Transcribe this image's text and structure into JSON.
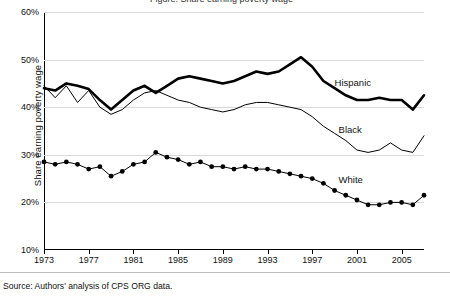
{
  "top_partial_title": "Figure: Share earning poverty wage",
  "axis": {
    "ylabel": "Share earning poverty wage",
    "yticks": [
      "10%",
      "20%",
      "30%",
      "40%",
      "50%",
      "60%"
    ],
    "xticks": [
      "1973",
      "1977",
      "1981",
      "1985",
      "1989",
      "1993",
      "1997",
      "2001",
      "2005"
    ]
  },
  "labels": {
    "hispanic": "Hispanic",
    "black": "Black",
    "white": "White"
  },
  "source": "Source: Authors' analysis of CPS ORG data.",
  "chart_data": {
    "type": "line",
    "title": "Share earning poverty wage",
    "xlabel": "",
    "ylabel": "Share earning poverty wage",
    "xlim": [
      1973,
      2007
    ],
    "ylim": [
      10,
      60
    ],
    "ytick_values": [
      10,
      20,
      30,
      40,
      50,
      60
    ],
    "ytick_labels": [
      "10%",
      "20%",
      "30%",
      "40%",
      "50%",
      "60%"
    ],
    "xtick_values": [
      1973,
      1977,
      1981,
      1985,
      1989,
      1993,
      1997,
      2001,
      2005
    ],
    "grid": false,
    "legend": "inline-annotations",
    "x": [
      1973,
      1974,
      1975,
      1976,
      1977,
      1978,
      1979,
      1980,
      1981,
      1982,
      1983,
      1984,
      1985,
      1986,
      1987,
      1988,
      1989,
      1990,
      1991,
      1992,
      1993,
      1994,
      1995,
      1996,
      1997,
      1998,
      1999,
      2000,
      2001,
      2002,
      2003,
      2004,
      2005,
      2006,
      2007
    ],
    "series": [
      {
        "name": "Hispanic",
        "style": "thick-line",
        "values": [
          44.0,
          43.5,
          45.0,
          44.5,
          43.8,
          41.5,
          39.5,
          41.5,
          43.5,
          44.5,
          43.0,
          44.5,
          46.0,
          46.5,
          46.0,
          45.5,
          45.0,
          45.5,
          46.5,
          47.5,
          47.0,
          47.5,
          49.0,
          50.5,
          48.5,
          45.5,
          44.0,
          42.5,
          41.5,
          41.5,
          42.0,
          41.5,
          41.5,
          39.5,
          42.5
        ]
      },
      {
        "name": "Black",
        "style": "thin-line",
        "values": [
          44.5,
          42.0,
          44.5,
          41.0,
          43.5,
          40.0,
          38.5,
          39.5,
          41.5,
          43.0,
          43.5,
          42.5,
          41.5,
          41.0,
          40.0,
          39.5,
          39.0,
          39.5,
          40.5,
          41.0,
          41.0,
          40.5,
          40.0,
          39.5,
          38.0,
          36.0,
          34.5,
          33.0,
          31.0,
          30.5,
          31.0,
          32.5,
          31.0,
          30.5,
          34.0
        ]
      },
      {
        "name": "White",
        "style": "line-with-markers",
        "values": [
          28.5,
          28.0,
          28.5,
          28.0,
          27.0,
          27.5,
          25.5,
          26.5,
          28.0,
          28.5,
          30.5,
          29.5,
          29.0,
          28.0,
          28.5,
          27.5,
          27.5,
          27.0,
          27.5,
          27.0,
          27.0,
          26.5,
          26.0,
          25.5,
          25.0,
          24.0,
          22.5,
          21.5,
          20.5,
          19.5,
          19.5,
          20.0,
          20.0,
          19.5,
          21.5
        ]
      }
    ]
  }
}
